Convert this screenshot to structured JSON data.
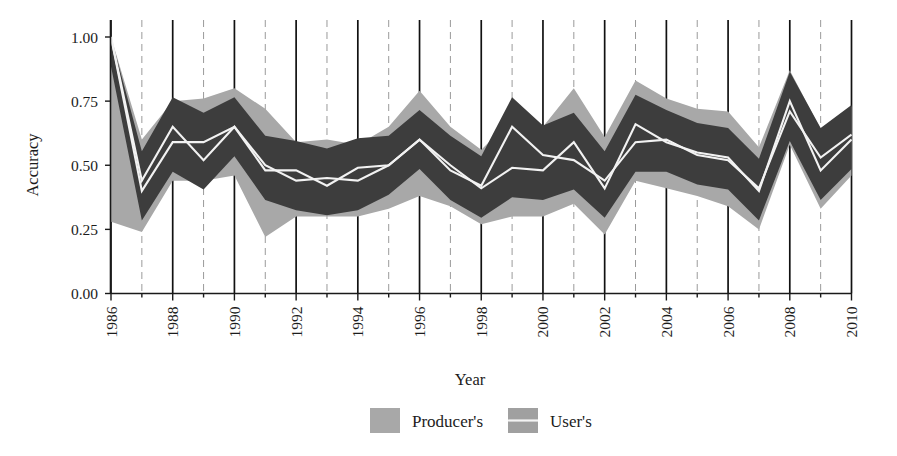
{
  "figure": {
    "background_color": "#ffffff",
    "axis_color": "#1a1a1a"
  },
  "axes": {
    "ylabel": "Accuracy",
    "xlabel": "Year",
    "yticks": [
      "0.00",
      "0.25",
      "0.50",
      "0.75",
      "1.00"
    ],
    "xticks": [
      "1986",
      "1988",
      "1990",
      "1992",
      "1994",
      "1996",
      "1998",
      "2000",
      "2002",
      "2004",
      "2006",
      "2008",
      "2010"
    ]
  },
  "legend": {
    "items": [
      {
        "label": "Producer's",
        "swatch_color": "#a8a8a8",
        "has_line": false
      },
      {
        "label": "User's",
        "swatch_color": "#a0a0a0",
        "has_line": true
      }
    ]
  },
  "chart_data": {
    "type": "area",
    "title": "",
    "xlabel": "Year",
    "ylabel": "Accuracy",
    "xlim": [
      1986,
      2010
    ],
    "ylim": [
      0.0,
      1.0
    ],
    "grid": true,
    "legend_position": "bottom-center",
    "colors": {
      "producers_band": "#a8a8a8",
      "users_band": "#a0a0a0",
      "overlap_band": "#3d3d3d",
      "mean_line": "#f2f2f2"
    },
    "x": [
      1986,
      1987,
      1988,
      1989,
      1990,
      1991,
      1992,
      1993,
      1994,
      1995,
      1996,
      1997,
      1998,
      1999,
      2000,
      2001,
      2002,
      2003,
      2004,
      2005,
      2006,
      2007,
      2008,
      2009,
      2010
    ],
    "series": [
      {
        "name": "Producer's",
        "mean": [
          1.0,
          0.4,
          0.59,
          0.59,
          0.65,
          0.5,
          0.44,
          0.45,
          0.44,
          0.5,
          0.6,
          0.5,
          0.41,
          0.49,
          0.48,
          0.59,
          0.41,
          0.66,
          0.59,
          0.55,
          0.53,
          0.4,
          0.75,
          0.48,
          0.6
        ],
        "lower": [
          0.28,
          0.24,
          0.44,
          0.44,
          0.46,
          0.22,
          0.3,
          0.3,
          0.3,
          0.33,
          0.38,
          0.34,
          0.27,
          0.3,
          0.3,
          0.35,
          0.23,
          0.44,
          0.41,
          0.38,
          0.34,
          0.25,
          0.58,
          0.33,
          0.46
        ],
        "upper": [
          1.0,
          0.6,
          0.75,
          0.76,
          0.8,
          0.72,
          0.59,
          0.6,
          0.58,
          0.65,
          0.79,
          0.65,
          0.56,
          0.68,
          0.65,
          0.8,
          0.61,
          0.83,
          0.76,
          0.72,
          0.71,
          0.57,
          0.87,
          0.64,
          0.73
        ]
      },
      {
        "name": "User's",
        "mean": [
          1.0,
          0.44,
          0.65,
          0.52,
          0.65,
          0.48,
          0.48,
          0.42,
          0.49,
          0.5,
          0.6,
          0.48,
          0.42,
          0.65,
          0.54,
          0.52,
          0.44,
          0.59,
          0.6,
          0.54,
          0.52,
          0.41,
          0.71,
          0.53,
          0.62
        ]
      }
    ]
  }
}
